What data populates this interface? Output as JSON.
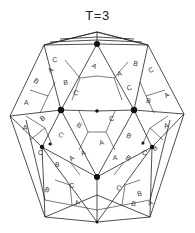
{
  "title": "T=3",
  "figure": {
    "subunit_labels": [
      "A",
      "B",
      "C"
    ],
    "fivefold_marker": "large-dot",
    "threefold_marker": "small-dot",
    "line_color": "#222222",
    "marker_color": "#111111"
  },
  "labels": [
    {
      "t": "A",
      "p": [
        52,
        72
      ]
    },
    {
      "t": "C",
      "p": [
        55,
        62
      ]
    },
    {
      "t": "B",
      "p": [
        35,
        83
      ]
    },
    {
      "t": "B",
      "p": [
        66,
        85
      ]
    },
    {
      "t": "A",
      "p": [
        93,
        68
      ]
    },
    {
      "t": "A",
      "p": [
        120,
        76
      ]
    },
    {
      "t": "C",
      "p": [
        75,
        95
      ]
    },
    {
      "t": "C",
      "p": [
        130,
        90
      ]
    },
    {
      "t": "B",
      "p": [
        135,
        66
      ]
    },
    {
      "t": "C",
      "p": [
        152,
        72
      ]
    },
    {
      "t": "B",
      "p": [
        148,
        103
      ]
    },
    {
      "t": "A",
      "p": [
        168,
        97
      ]
    },
    {
      "t": "A",
      "p": [
        26,
        105
      ]
    },
    {
      "t": "B",
      "p": [
        44,
        120
      ]
    },
    {
      "t": "A",
      "p": [
        25,
        130
      ]
    },
    {
      "t": "B",
      "p": [
        78,
        127
      ]
    },
    {
      "t": "C",
      "p": [
        112,
        121
      ]
    },
    {
      "t": "C",
      "p": [
        60,
        137
      ]
    },
    {
      "t": "A",
      "p": [
        102,
        145
      ]
    },
    {
      "t": "B",
      "p": [
        128,
        138
      ]
    },
    {
      "t": "A",
      "p": [
        167,
        128
      ]
    },
    {
      "t": "C",
      "p": [
        144,
        155
      ]
    },
    {
      "t": "A",
      "p": [
        84,
        155
      ]
    },
    {
      "t": "C",
      "p": [
        40,
        155
      ]
    },
    {
      "t": "B",
      "p": [
        156,
        150
      ]
    },
    {
      "t": "B",
      "p": [
        57,
        167
      ]
    },
    {
      "t": "A",
      "p": [
        73,
        160
      ]
    },
    {
      "t": "A",
      "p": [
        115,
        160
      ]
    },
    {
      "t": "B",
      "p": [
        127,
        160
      ]
    },
    {
      "t": "C",
      "p": [
        72,
        188
      ]
    },
    {
      "t": "B",
      "p": [
        46,
        192
      ]
    },
    {
      "t": "B",
      "p": [
        140,
        196
      ]
    },
    {
      "t": "C",
      "p": [
        118,
        190
      ]
    },
    {
      "t": "A",
      "p": [
        78,
        205
      ]
    },
    {
      "t": "B",
      "p": [
        133,
        206
      ]
    },
    {
      "t": "A",
      "p": [
        151,
        205
      ]
    }
  ]
}
